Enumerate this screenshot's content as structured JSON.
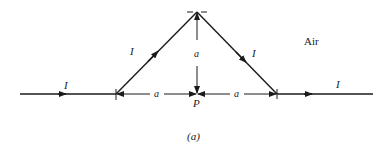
{
  "diagram": {
    "caption": "(a)",
    "medium_label": "Air",
    "current_labels": {
      "left_wire": "I",
      "left_diagonal": "I",
      "right_diagonal": "I",
      "right_wire": "I"
    },
    "dimension_labels": {
      "vertical": "a",
      "left_horizontal": "a",
      "right_horizontal": "a"
    },
    "point_label": "P",
    "colors": {
      "stroke": "#1a1a1a",
      "background": "#ffffff"
    }
  }
}
